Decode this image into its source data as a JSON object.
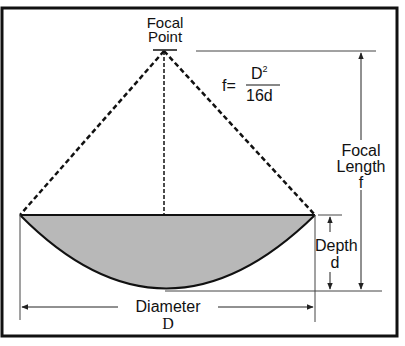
{
  "diagram": {
    "labels": {
      "focal_point_line1": "Focal",
      "focal_point_line2": "Point",
      "formula_lhs": "f=",
      "formula_numerator": "D",
      "formula_numerator_exp": "2",
      "formula_denominator": "16d",
      "focal_length_line1": "Focal",
      "focal_length_line2": "Length",
      "focal_length_symbol": "f",
      "depth_label": "Depth",
      "depth_symbol": "d",
      "diameter_label": "Diameter",
      "diameter_symbol": "D"
    },
    "colors": {
      "border": "#111111",
      "dish_fill": "#b8b8b8",
      "line": "#222222",
      "background": "#ffffff"
    }
  }
}
